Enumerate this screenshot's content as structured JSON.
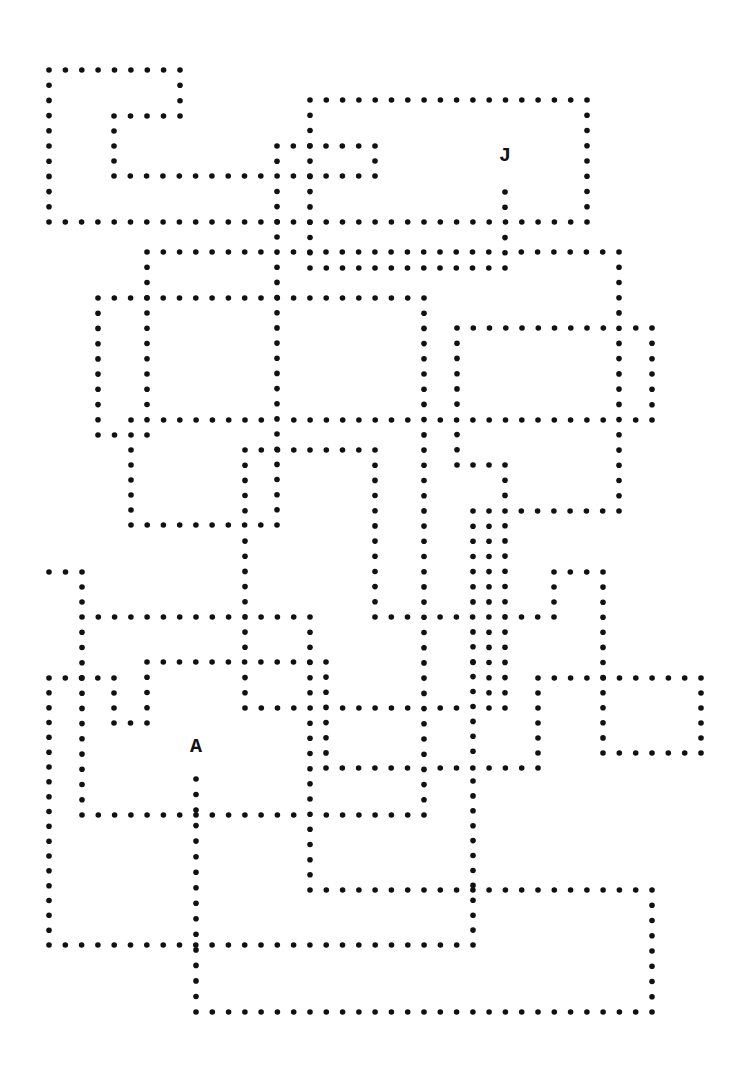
{
  "puzzle": {
    "type": "dotted-path maze",
    "dot_color": "#111111",
    "background": "#ffffff",
    "dot_spacing": 16.3,
    "labels": [
      {
        "text": "J",
        "x": 505,
        "y": 155,
        "role": "end"
      },
      {
        "text": "A",
        "x": 196,
        "y": 746,
        "role": "start"
      }
    ],
    "paths": [
      [
        [
          49,
          70
        ],
        [
          180,
          70
        ],
        [
          180,
          116
        ],
        [
          114,
          116
        ],
        [
          114,
          176
        ],
        [
          375,
          176
        ]
      ],
      [
        [
          277,
          146
        ],
        [
          375,
          146
        ],
        [
          375,
          176
        ]
      ],
      [
        [
          49,
          70
        ],
        [
          49,
          222
        ],
        [
          587,
          222
        ]
      ],
      [
        [
          310,
          100
        ],
        [
          587,
          100
        ],
        [
          587,
          222
        ]
      ],
      [
        [
          310,
          100
        ],
        [
          310,
          268
        ],
        [
          505,
          268
        ]
      ],
      [
        [
          505,
          192
        ],
        [
          505,
          268
        ]
      ],
      [
        [
          277,
          146
        ],
        [
          277,
          525
        ]
      ],
      [
        [
          147,
          252
        ],
        [
          619,
          252
        ],
        [
          619,
          511
        ],
        [
          505,
          511
        ]
      ],
      [
        [
          98,
          298
        ],
        [
          424,
          298
        ],
        [
          424,
          815
        ]
      ],
      [
        [
          98,
          298
        ],
        [
          98,
          435
        ],
        [
          131,
          435
        ]
      ],
      [
        [
          147,
          252
        ],
        [
          147,
          435
        ]
      ],
      [
        [
          131,
          420
        ],
        [
          652,
          420
        ]
      ],
      [
        [
          457,
          328
        ],
        [
          652,
          328
        ],
        [
          652,
          420
        ]
      ],
      [
        [
          457,
          328
        ],
        [
          457,
          465
        ],
        [
          505,
          465
        ],
        [
          505,
          708
        ]
      ],
      [
        [
          131,
          420
        ],
        [
          131,
          525
        ],
        [
          277,
          525
        ]
      ],
      [
        [
          245,
          450
        ],
        [
          375,
          450
        ],
        [
          375,
          617
        ],
        [
          554,
          617
        ],
        [
          554,
          572
        ],
        [
          603,
          572
        ],
        [
          603,
          753
        ],
        [
          701,
          753
        ],
        [
          701,
          678
        ],
        [
          538,
          678
        ],
        [
          538,
          768
        ],
        [
          326,
          768
        ],
        [
          326,
          662
        ],
        [
          147,
          662
        ],
        [
          147,
          723
        ],
        [
          114,
          723
        ],
        [
          114,
          678
        ],
        [
          49,
          678
        ],
        [
          49,
          945
        ],
        [
          473,
          945
        ],
        [
          473,
          617
        ]
      ],
      [
        [
          245,
          450
        ],
        [
          245,
          708
        ],
        [
          489,
          708
        ],
        [
          489,
          511
        ],
        [
          473,
          511
        ],
        [
          473,
          708
        ]
      ],
      [
        [
          49,
          572
        ],
        [
          82,
          572
        ],
        [
          82,
          617
        ],
        [
          310,
          617
        ],
        [
          310,
          890
        ],
        [
          652,
          890
        ],
        [
          652,
          1012
        ],
        [
          196,
          1012
        ],
        [
          196,
          779
        ]
      ],
      [
        [
          82,
          617
        ],
        [
          82,
          815
        ],
        [
          424,
          815
        ]
      ],
      [
        [
          245,
          617
        ],
        [
          245,
          662
        ]
      ]
    ]
  }
}
